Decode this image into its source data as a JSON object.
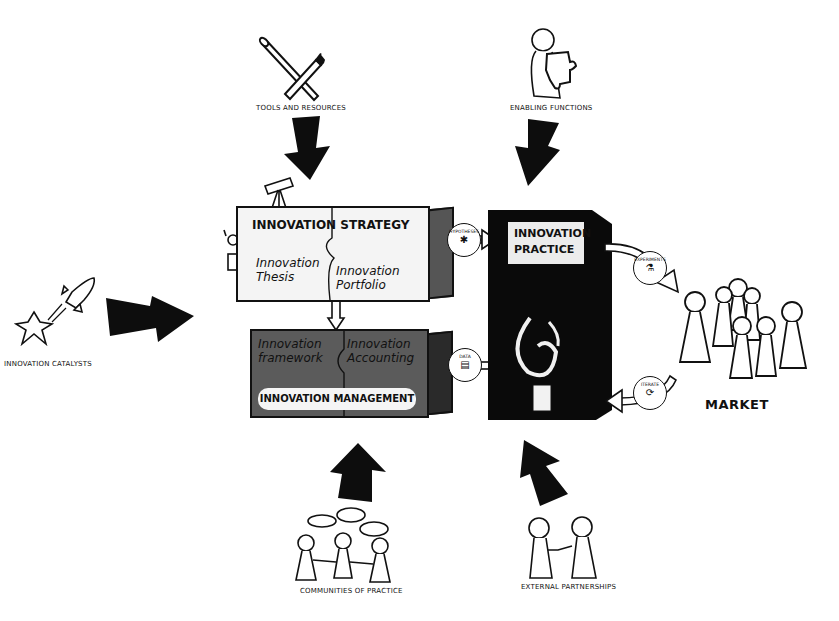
{
  "diagram": {
    "central": {
      "strategy": {
        "title": "INNOVATION STRATEGY",
        "left_piece": "Innovation Thesis",
        "right_piece": "Innovation Portfolio"
      },
      "management": {
        "title": "INNOVATION MANAGEMENT",
        "left_piece": "Innovation framework",
        "right_piece": "Innovation Accounting"
      },
      "practice": {
        "title_line1": "INNOVATION",
        "title_line2": "PRACTICE"
      }
    },
    "badges": {
      "to_practice": {
        "label": "Hypotheses",
        "icon": "puzzle-icon"
      },
      "to_management": {
        "label": "Data",
        "icon": "data-icon"
      },
      "to_market": {
        "label": "Experiments",
        "icon": "flask-icon"
      },
      "from_market": {
        "label": "Iterate",
        "icon": "cycle-icon"
      }
    },
    "inputs": {
      "top_left": "Tools and resources",
      "top_right": "Enabling functions",
      "left": "Innovation catalysts",
      "bottom_left": "Communities of practice",
      "bottom_right": "External partnerships"
    },
    "market_label": "MARKET",
    "colors": {
      "ink": "#111111",
      "strategy_fill": "#f4f4f4",
      "management_fill": "#5b5b5b",
      "practice_fill": "#0a0a0a",
      "background": "#ffffff"
    }
  }
}
